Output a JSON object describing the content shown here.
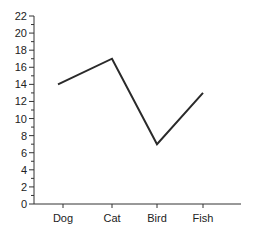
{
  "chart_data": {
    "type": "line",
    "title": "",
    "xlabel": "",
    "ylabel": "",
    "categories": [
      "Dog",
      "Cat",
      "Bird",
      "Fish"
    ],
    "values": [
      14,
      17,
      7,
      13
    ],
    "ylim": [
      0,
      22
    ],
    "y_major_ticks": [
      0,
      2,
      4,
      6,
      8,
      10,
      12,
      14,
      16,
      18,
      20,
      22
    ],
    "y_minor_step": 1,
    "grid": false,
    "legend": null,
    "colors": {
      "line": "#2a2a2a",
      "axis": "#333333",
      "text": "#222222"
    }
  }
}
